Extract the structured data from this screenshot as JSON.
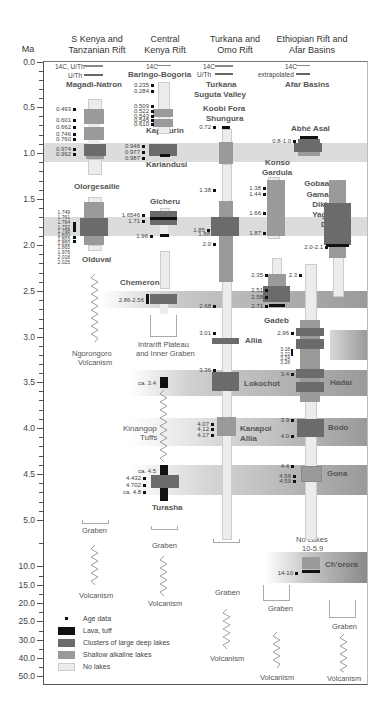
{
  "axis": {
    "unit_label": "Ma",
    "ticks": [
      {
        "label": "0.0",
        "y": 62
      },
      {
        "label": "0.5",
        "y": 107
      },
      {
        "label": "1.0",
        "y": 153
      },
      {
        "label": "1.5",
        "y": 199
      },
      {
        "label": "2.0",
        "y": 245
      },
      {
        "label": "2.5",
        "y": 291
      },
      {
        "label": "3.0",
        "y": 337
      },
      {
        "label": "3.5",
        "y": 382
      },
      {
        "label": "4.0",
        "y": 428
      },
      {
        "label": "4.5",
        "y": 474
      },
      {
        "label": "5.0",
        "y": 520
      },
      {
        "label": "10.0",
        "y": 566
      },
      {
        "label": "15.0",
        "y": 585
      },
      {
        "label": "20.0",
        "y": 603
      },
      {
        "label": "25.0",
        "y": 621
      },
      {
        "label": "30.0",
        "y": 640
      },
      {
        "label": "40.0",
        "y": 658
      },
      {
        "label": "50.0",
        "y": 676
      }
    ]
  },
  "columns": [
    {
      "title_line1": "S Kenya and",
      "title_line2": "Tanzanian Rift"
    },
    {
      "title_line1": "Central",
      "title_line2": "Kenya Rift"
    },
    {
      "title_line1": "Turkana and",
      "title_line2": "Omo Rift"
    },
    {
      "title_line1": "Ethiopian Rift and",
      "title_line2": "Afar Basins"
    }
  ],
  "method_keys": {
    "col1_a": "14C, U/Th",
    "col1_b": "U/Th",
    "col2_a": "14C",
    "col3_a": "14C",
    "col3_b": "U/Th",
    "col4_a": "14C",
    "col4_b": "extrapolated"
  },
  "basins": {
    "magadi": "Magadi-Natron",
    "baringo": "Baringo-Bogoria",
    "turkana_l1": "Turkana",
    "turkana_l2": "Suguta Valley",
    "afar": "Afar Basins",
    "koobi_l1": "Koobi Fora",
    "koobi_l2": "Shungura",
    "kapthurin": "Kapthurin",
    "abhe": "Abhé Asal",
    "kariandusi": "Kariandusi",
    "olorgesailie": "Olorgesailie",
    "konso_l1": "Konso",
    "konso_l2": "Gardula",
    "gicheru": "Gicheru",
    "gobaad": [
      "Gobaad",
      "Gamari",
      "Dikhil",
      "Yager",
      "Dat",
      "Ali"
    ],
    "olduvai": "Olduvai",
    "chemeron": "Chemeron",
    "gadeb": "Gadeb",
    "allia1": "Allia",
    "lokochot": "Lokochot",
    "hadar": "Hadar",
    "kinangop_l1": "Kinangop",
    "kinangop_l2": "Tuffs",
    "kanapoi_l1": "Kanapoi",
    "kanapoi_l2": "Allia",
    "bodo": "Bodo",
    "gona": "Gona",
    "turasha": "Turasha",
    "chorora": "Ch'orora",
    "nolakes_l1": "No Lakes",
    "nolakes_l2": "10-5.9"
  },
  "notes": {
    "ngorongoro_l1": "Ngorongoro",
    "ngorongoro_l2": "Volcanism",
    "intrarift_l1": "Intrarift Plateau",
    "intrarift_l2": "and Inner Graben",
    "graben": "Graben",
    "volcanism": "Volcanism"
  },
  "ages": {
    "c1": [
      "0.493",
      "0.601",
      "0.662",
      "0.746",
      "0.760",
      "0.974",
      "0.992",
      "1.749",
      "1.761",
      "1.764",
      "1.792",
      "1.798",
      "1.800",
      "1.803",
      "1.850",
      "1.865",
      "1.976",
      "2.018",
      "2.025"
    ],
    "c2": [
      "0.235",
      "0.284",
      "0.509",
      "0.522",
      "0.543",
      "0.545",
      "0.610",
      "0.946",
      "0.977",
      "0.987",
      "1.6546",
      "1.71",
      "1.96",
      "2.86-2.56",
      "ca. 3.4",
      "ca. 4.5",
      "4.432",
      "4.702",
      "ca. 4.8"
    ],
    "c3": [
      "0.72",
      "1.38",
      "1.85",
      "1.88",
      "2.0",
      "2.68",
      "3.01",
      "3.36",
      "4.07",
      "4.12",
      "4.17"
    ],
    "c4": [
      "0.8-1.0",
      "1.38",
      "1.44",
      "1.66",
      "1.87",
      "2.35",
      "2.51",
      "2.58",
      "2.71",
      "2.3",
      "2.96",
      "3.18",
      "3.22",
      "3.24",
      "3.28",
      "3.4",
      "3.9",
      "4.0",
      "4.4",
      "4.56",
      "4.59",
      "2.0-2.1",
      "14-10"
    ]
  },
  "legend": [
    {
      "label": "Age data",
      "type": "square",
      "color": "#111111"
    },
    {
      "label": "Lava, tuff",
      "type": "swatch",
      "color": "#111111"
    },
    {
      "label": "Clusters of large deep lakes",
      "type": "swatch",
      "color": "#6b6b6b"
    },
    {
      "label": "Shallow alkaline lakes",
      "type": "swatch",
      "color": "#9a9a9a"
    },
    {
      "label": "No lakes",
      "type": "swatch",
      "color": "#ececec"
    }
  ],
  "colors": {
    "lava": "#111111",
    "deep": "#6b6b6b",
    "shallow": "#9a9a9a",
    "nolakes": "#ececec",
    "band": "#d8d8d8"
  }
}
